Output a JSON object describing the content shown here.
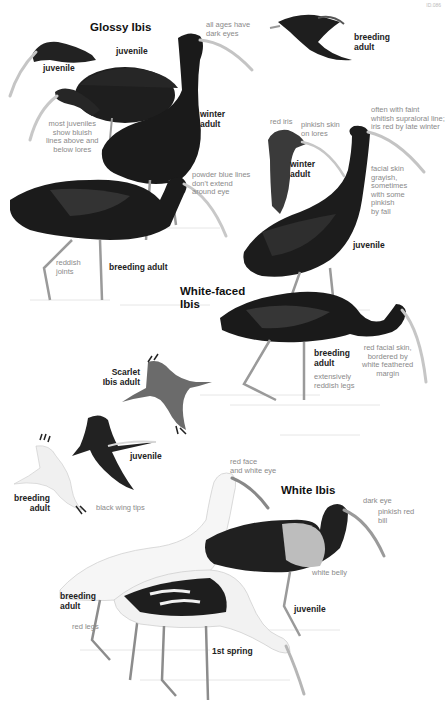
{
  "page": {
    "number": "ID.086"
  },
  "species": {
    "glossy": {
      "title": "Glossy Ibis",
      "labels": {
        "juvenile_head": "juvenile",
        "juvenile_body": "juvenile",
        "winter_adult": "winter\nadult",
        "breeding_adult": "breeding adult",
        "breeding_adult_flight": "breeding\nadult"
      },
      "notes": {
        "dark_eyes": "all ages have\ndark eyes",
        "bluish_lines": "most juveniles\nshow bluish\nlines above and\nbelow lores",
        "powder_blue": "powder blue lines\ndon't extend\naround eye",
        "reddish_joints": "reddish\njoints"
      }
    },
    "white_faced": {
      "title": "White-faced\nIbis",
      "labels": {
        "winter_adult": "winter\nadult",
        "juvenile": "juvenile",
        "breeding_adult": "breeding\nadult"
      },
      "notes": {
        "red_iris": "red iris",
        "pinkish_lores": "pinkish skin\non lores",
        "supraloral": "often with faint\nwhitish supraloral line;\niris red by late winter",
        "facial_skin": "facial skin\ngrayish,\nsometimes\nwith some\npinkish\nby fall",
        "red_facial": "red facial skin,\nbordered by\nwhite feathered\nmargin",
        "reddish_legs": "extensively\nreddish legs"
      }
    },
    "scarlet": {
      "title": "Scarlet\nIbis adult"
    },
    "white": {
      "title": "White Ibis",
      "labels": {
        "juvenile_flight": "juvenile",
        "breeding_adult_flight": "breeding\nadult",
        "breeding_adult": "breeding\nadult",
        "juvenile": "juvenile",
        "first_spring": "1st spring"
      },
      "notes": {
        "black_wing_tips": "black wing tips",
        "red_face": "red face\nand white eye",
        "dark_eye": "dark eye",
        "pinkish_bill": "pinkish red\nbill",
        "white_belly": "white belly",
        "red_legs": "red legs"
      }
    }
  },
  "colors": {
    "dark_plumage": "#1c1c1c",
    "mid_plumage": "#3a3a3a",
    "scarlet_gray": "#6b6b6b",
    "white_plumage": "#f4f4f4",
    "bill": "#c9c9c9",
    "leg": "#9a9a9a",
    "note_text": "#8a8a8a"
  }
}
